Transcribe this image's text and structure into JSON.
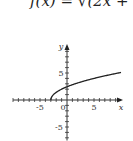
{
  "chart_data": {
    "type": "line",
    "title": "f(x) = √(2x + 6)",
    "xlabel": "x",
    "ylabel": "y",
    "xlim": [
      -10,
      10
    ],
    "ylim": [
      -12,
      8
    ],
    "xticks_labeled": [
      "-5",
      "0",
      "5"
    ],
    "yticks_labeled": [
      "5",
      "-5"
    ],
    "series": [
      {
        "name": "f(x)",
        "x": [
          -3,
          -2.5,
          -2,
          -1,
          0,
          1,
          2,
          3,
          4,
          5,
          6,
          7,
          8.5
        ],
        "y": [
          0,
          1,
          1.41,
          2,
          2.45,
          2.83,
          3.16,
          3.46,
          3.74,
          4,
          4.24,
          4.47,
          4.8
        ]
      }
    ],
    "grid": false
  }
}
